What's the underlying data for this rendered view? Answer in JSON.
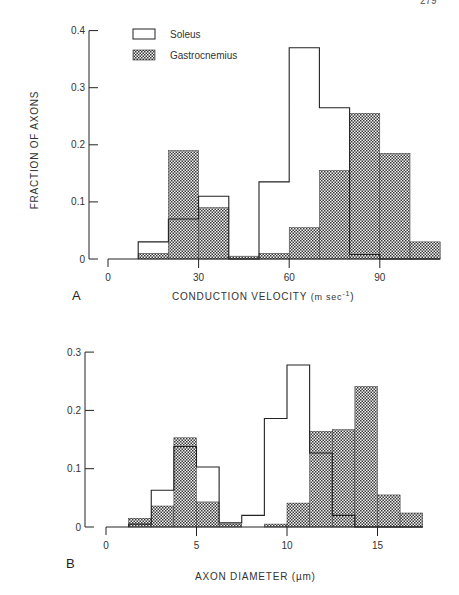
{
  "page_number": "279",
  "legend": {
    "items": [
      {
        "label": "Soleus",
        "style": "open"
      },
      {
        "label": "Gastrocnemius",
        "style": "stippled"
      }
    ]
  },
  "colors": {
    "line": "#222222",
    "stipple_fg": "#3a3a3a",
    "stipple_bg": "#f2f2f2",
    "background": "#ffffff"
  },
  "chart_data": [
    {
      "panel": "A",
      "type": "bar",
      "title": "",
      "xlabel": "CONDUCTION VELOCITY (m sec-1)",
      "xlabel_main": "CONDUCTION VELOCITY",
      "xlabel_unit": "(m sec",
      "xlabel_sup": "-1",
      "xlabel_close": ")",
      "ylabel": "FRACTION OF AXONS",
      "xlim": [
        0,
        110
      ],
      "ylim": [
        0,
        0.4
      ],
      "xticks": [
        0,
        30,
        60,
        90
      ],
      "yticks": [
        0,
        0.1,
        0.2,
        0.3,
        0.4
      ],
      "ytick_labels": [
        "0",
        "0.1",
        "0.2",
        "0.3",
        "0.4"
      ],
      "bin_width": 10,
      "bin_edges": [
        10,
        20,
        30,
        40,
        50,
        60,
        70,
        80,
        90,
        100,
        110
      ],
      "series": [
        {
          "name": "Soleus",
          "values": [
            0.03,
            0.07,
            0.11,
            0.0,
            0.135,
            0.37,
            0.265,
            0.008,
            0.0,
            0.0
          ]
        },
        {
          "name": "Gastrocnemius",
          "values": [
            0.01,
            0.19,
            0.09,
            0.005,
            0.01,
            0.055,
            0.155,
            0.255,
            0.185,
            0.03
          ]
        }
      ],
      "grid": false,
      "legend_position": "upper-left inside"
    },
    {
      "panel": "B",
      "type": "bar",
      "title": "",
      "xlabel": "AXON DIAMETER (µm)",
      "ylabel": "",
      "xlim": [
        0,
        17.5
      ],
      "ylim": [
        0,
        0.3
      ],
      "xticks": [
        0,
        5,
        10,
        15
      ],
      "yticks": [
        0,
        0.1,
        0.2,
        0.3
      ],
      "ytick_labels": [
        "0",
        "0.1",
        "0.2",
        "0.3"
      ],
      "bin_width": 1.25,
      "bin_edges": [
        1.25,
        2.5,
        3.75,
        5,
        6.25,
        7.5,
        8.75,
        10,
        11.25,
        12.5,
        13.75,
        15,
        16.25,
        17.5
      ],
      "series": [
        {
          "name": "Soleus",
          "values": [
            0.005,
            0.063,
            0.138,
            0.103,
            0.007,
            0.02,
            0.186,
            0.278,
            0.127,
            0.02,
            0.0,
            0.0,
            0.0
          ]
        },
        {
          "name": "Gastrocnemius",
          "values": [
            0.015,
            0.036,
            0.153,
            0.043,
            0.005,
            0.0,
            0.005,
            0.041,
            0.164,
            0.167,
            0.241,
            0.055,
            0.024
          ]
        }
      ],
      "grid": false
    }
  ]
}
